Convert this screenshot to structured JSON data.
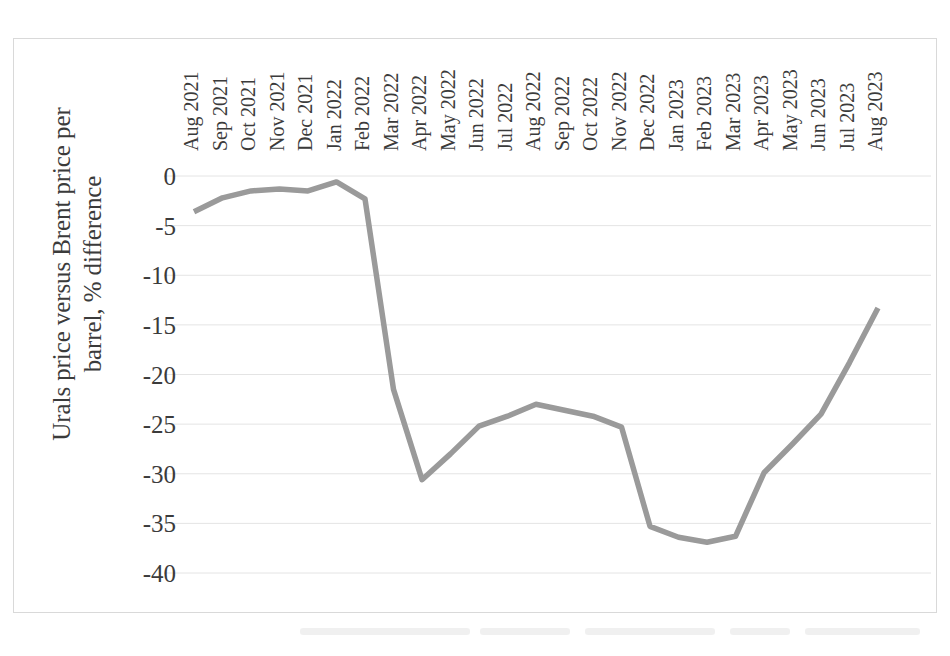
{
  "chart_data": {
    "type": "line",
    "title": "",
    "xlabel": "",
    "ylabel": "Urals price versus Brent price per barrel, % difference",
    "ylabel_lines": [
      "Urals price versus Brent price per",
      "barrel, % difference"
    ],
    "ylim": [
      -40,
      0
    ],
    "ytick_labels": [
      "0",
      "-5",
      "-10",
      "-15",
      "-20",
      "-25",
      "-30",
      "-35",
      "-40"
    ],
    "ytick_values": [
      0,
      -5,
      -10,
      -15,
      -20,
      -25,
      -30,
      -35,
      -40
    ],
    "grid": true,
    "legend": "none",
    "line_color": "#9a9a9a",
    "categories": [
      "Aug 2021",
      "Sep 2021",
      "Oct 2021",
      "Nov 2021",
      "Dec 2021",
      "Jan 2022",
      "Feb 2022",
      "Mar 2022",
      "Apr 2022",
      "May 2022",
      "Jun 2022",
      "Jul 2022",
      "Aug 2022",
      "Sep 2022",
      "Oct 2022",
      "Nov 2022",
      "Dec 2022",
      "Jan 2023",
      "Feb 2023",
      "Mar 2023",
      "Apr 2023",
      "May 2023",
      "Jun 2023",
      "Jul 2023",
      "Aug 2023"
    ],
    "values": [
      -3.6,
      -2.2,
      -1.5,
      -1.3,
      -1.5,
      -0.6,
      -2.3,
      -21.5,
      -30.6,
      -28.0,
      -25.2,
      -24.2,
      -23.0,
      -23.6,
      -24.2,
      -25.3,
      -35.3,
      -36.4,
      -36.9,
      -36.3,
      -29.9,
      -27.0,
      -24.0,
      -18.8,
      -13.3
    ]
  }
}
